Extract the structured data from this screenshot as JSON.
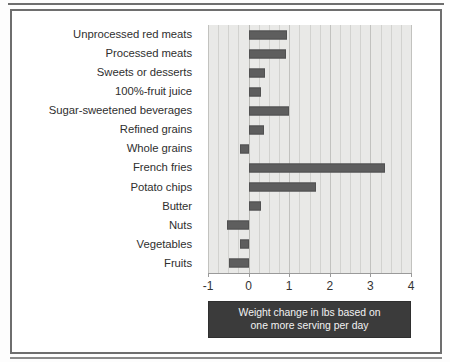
{
  "figure": {
    "caption_line1": "Weight change in lbs based on",
    "caption_line2": "one more serving per day"
  },
  "chart_data": {
    "type": "bar",
    "orientation": "horizontal",
    "title": "",
    "xlabel": "Weight change in lbs based on one more serving per day",
    "ylabel": "",
    "xlim": [
      -1,
      4
    ],
    "xticks": [
      -1,
      0,
      1,
      2,
      3,
      4
    ],
    "xtick_labels": [
      "-1",
      "0",
      "1",
      "2",
      "3",
      "4"
    ],
    "grid": true,
    "grid_axis": "x",
    "legend": false,
    "bar_color": "#5e5e5e",
    "plot_background": "#e9e9e7",
    "categories": [
      "Unprocessed red meats",
      "Processed meats",
      "Sweets or desserts",
      "100%-fruit juice",
      "Sugar-sweetened beverages",
      "Refined grains",
      "Whole grains",
      "French fries",
      "Potato chips",
      "Butter",
      "Nuts",
      "Vegetables",
      "Fruits"
    ],
    "values": [
      0.95,
      0.93,
      0.41,
      0.31,
      1.0,
      0.39,
      -0.2,
      3.35,
      1.65,
      0.3,
      -0.52,
      -0.22,
      -0.48
    ],
    "units": "lbs"
  }
}
